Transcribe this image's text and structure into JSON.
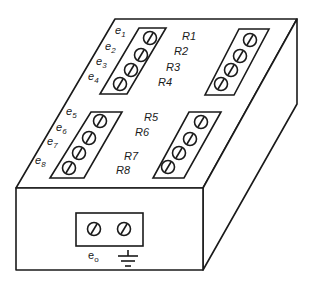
{
  "diagram": {
    "title": "",
    "colors": {
      "line": "#1a1a1a",
      "background": "#ffffff"
    },
    "input_labels": [
      {
        "base": "e",
        "sub": "1"
      },
      {
        "base": "e",
        "sub": "2"
      },
      {
        "base": "e",
        "sub": "3"
      },
      {
        "base": "e",
        "sub": "4"
      },
      {
        "base": "e",
        "sub": "5"
      },
      {
        "base": "e",
        "sub": "6"
      },
      {
        "base": "e",
        "sub": "7"
      },
      {
        "base": "e",
        "sub": "8"
      }
    ],
    "resistor_labels": [
      "R1",
      "R2",
      "R3",
      "R4",
      "R5",
      "R6",
      "R7",
      "R8"
    ],
    "terminal_strips": [
      {
        "name": "input-strip-e1-e4",
        "screws": 4
      },
      {
        "name": "resistor-strip-r1-r4",
        "screws": 4
      },
      {
        "name": "input-strip-e5-e8",
        "screws": 4
      },
      {
        "name": "resistor-strip-r5-r8",
        "screws": 4
      }
    ],
    "output": {
      "label_base": "e",
      "label_sub": "o",
      "ground_symbol": "ground-icon",
      "screws": 2
    }
  }
}
